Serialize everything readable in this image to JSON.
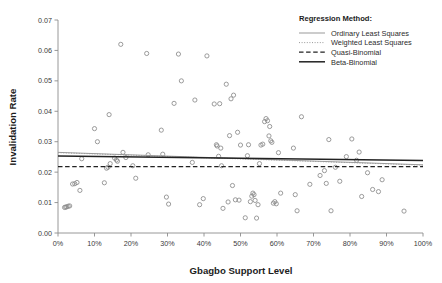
{
  "chart_data": {
    "type": "scatter",
    "title": "",
    "xlabel": "Gbagbo Support Level",
    "ylabel": "Invalidation Rate",
    "xlim": [
      0,
      1.0
    ],
    "ylim": [
      0,
      0.07
    ],
    "grid": false,
    "x_tick_labels": [
      "0%",
      "10%",
      "20%",
      "30%",
      "40%",
      "50%",
      "60%",
      "70%",
      "80%",
      "90%",
      "100%"
    ],
    "x_tick_values": [
      0,
      0.1,
      0.2,
      0.3,
      0.4,
      0.5,
      0.6,
      0.7,
      0.8,
      0.9,
      1.0
    ],
    "y_tick_labels": [
      "0.00",
      "0.01",
      "0.02",
      "0.03",
      "0.04",
      "0.05",
      "0.06",
      "0.07"
    ],
    "y_tick_values": [
      0.0,
      0.01,
      0.02,
      0.03,
      0.04,
      0.05,
      0.06,
      0.07
    ],
    "legend": {
      "position": "top-right",
      "title": "Regression Method:",
      "entries": [
        {
          "label": "Ordinary Least Squares",
          "style": "solid-thin",
          "color": "#999999"
        },
        {
          "label": "Weighted Least Squares",
          "style": "dotted",
          "color": "#999999"
        },
        {
          "label": "Quasi-Binomial",
          "style": "dashed",
          "color": "#222222"
        },
        {
          "label": "Beta-Binomial",
          "style": "solid-thick",
          "color": "#222222"
        }
      ]
    },
    "series": [
      {
        "name": "Constituencies",
        "type": "scatter",
        "marker": "open-circle",
        "color": "#8a8a8a",
        "points": [
          [
            0.018,
            0.0084
          ],
          [
            0.021,
            0.0085
          ],
          [
            0.024,
            0.0086
          ],
          [
            0.028,
            0.0088
          ],
          [
            0.032,
            0.0089
          ],
          [
            0.04,
            0.0161
          ],
          [
            0.046,
            0.0162
          ],
          [
            0.052,
            0.0166
          ],
          [
            0.06,
            0.014
          ],
          [
            0.065,
            0.0244
          ],
          [
            0.1,
            0.0343
          ],
          [
            0.108,
            0.03
          ],
          [
            0.127,
            0.0165
          ],
          [
            0.133,
            0.0213
          ],
          [
            0.137,
            0.0216
          ],
          [
            0.14,
            0.0389
          ],
          [
            0.143,
            0.0228
          ],
          [
            0.155,
            0.0246
          ],
          [
            0.16,
            0.024
          ],
          [
            0.163,
            0.0236
          ],
          [
            0.172,
            0.062
          ],
          [
            0.178,
            0.0265
          ],
          [
            0.186,
            0.0248
          ],
          [
            0.205,
            0.0221
          ],
          [
            0.213,
            0.018
          ],
          [
            0.243,
            0.059
          ],
          [
            0.247,
            0.0257
          ],
          [
            0.283,
            0.0338
          ],
          [
            0.287,
            0.0259
          ],
          [
            0.297,
            0.0118
          ],
          [
            0.303,
            0.0095
          ],
          [
            0.318,
            0.0426
          ],
          [
            0.33,
            0.0588
          ],
          [
            0.338,
            0.05
          ],
          [
            0.368,
            0.0232
          ],
          [
            0.375,
            0.0437
          ],
          [
            0.388,
            0.0093
          ],
          [
            0.398,
            0.0113
          ],
          [
            0.408,
            0.0582
          ],
          [
            0.428,
            0.0424
          ],
          [
            0.434,
            0.029
          ],
          [
            0.436,
            0.0286
          ],
          [
            0.44,
            0.0252
          ],
          [
            0.443,
            0.0425
          ],
          [
            0.446,
            0.0279
          ],
          [
            0.448,
            0.0221
          ],
          [
            0.452,
            0.0081
          ],
          [
            0.461,
            0.0489
          ],
          [
            0.466,
            0.0102
          ],
          [
            0.47,
            0.032
          ],
          [
            0.474,
            0.0441
          ],
          [
            0.478,
            0.0156
          ],
          [
            0.481,
            0.0453
          ],
          [
            0.486,
            0.0109
          ],
          [
            0.492,
            0.0331
          ],
          [
            0.496,
            0.0108
          ],
          [
            0.5,
            0.0289
          ],
          [
            0.513,
            0.005
          ],
          [
            0.519,
            0.0254
          ],
          [
            0.522,
            0.029
          ],
          [
            0.527,
            0.0103
          ],
          [
            0.531,
            0.0121
          ],
          [
            0.534,
            0.0131
          ],
          [
            0.537,
            0.0126
          ],
          [
            0.54,
            0.0107
          ],
          [
            0.544,
            0.0049
          ],
          [
            0.548,
            0.0093
          ],
          [
            0.552,
            0.0228
          ],
          [
            0.556,
            0.0289
          ],
          [
            0.561,
            0.0292
          ],
          [
            0.566,
            0.0366
          ],
          [
            0.57,
            0.0376
          ],
          [
            0.574,
            0.0369
          ],
          [
            0.578,
            0.0319
          ],
          [
            0.58,
            0.035
          ],
          [
            0.583,
            0.0303
          ],
          [
            0.586,
            0.0298
          ],
          [
            0.59,
            0.0098
          ],
          [
            0.594,
            0.0103
          ],
          [
            0.598,
            0.0096
          ],
          [
            0.604,
            0.0264
          ],
          [
            0.61,
            0.0131
          ],
          [
            0.645,
            0.0279
          ],
          [
            0.65,
            0.0126
          ],
          [
            0.655,
            0.0073
          ],
          [
            0.667,
            0.0382
          ],
          [
            0.69,
            0.016
          ],
          [
            0.718,
            0.0189
          ],
          [
            0.73,
            0.0205
          ],
          [
            0.735,
            0.0163
          ],
          [
            0.742,
            0.0307
          ],
          [
            0.748,
            0.0073
          ],
          [
            0.76,
            0.0216
          ],
          [
            0.772,
            0.017
          ],
          [
            0.79,
            0.0251
          ],
          [
            0.805,
            0.0309
          ],
          [
            0.818,
            0.0239
          ],
          [
            0.825,
            0.0266
          ],
          [
            0.832,
            0.012
          ],
          [
            0.848,
            0.0198
          ],
          [
            0.862,
            0.0143
          ],
          [
            0.878,
            0.0136
          ],
          [
            0.888,
            0.0175
          ],
          [
            0.948,
            0.0072
          ]
        ]
      }
    ],
    "regression_lines": [
      {
        "name": "Ordinary Least Squares",
        "style": "solid-thin",
        "color": "#9a9a9a",
        "x0": 0.0,
        "y0": 0.0265,
        "x1": 1.0,
        "y1": 0.0224
      },
      {
        "name": "Weighted Least Squares",
        "style": "dotted",
        "color": "#9a9a9a",
        "x0": 0.0,
        "y0": 0.0264,
        "x1": 1.0,
        "y1": 0.0223
      },
      {
        "name": "Quasi-Binomial",
        "style": "dashed",
        "color": "#222222",
        "x0": 0.0,
        "y0": 0.0218,
        "x1": 1.0,
        "y1": 0.0218
      },
      {
        "name": "Beta-Binomial",
        "style": "solid-thick",
        "color": "#222222",
        "x0": 0.0,
        "y0": 0.0253,
        "x1": 1.0,
        "y1": 0.0238
      }
    ]
  }
}
